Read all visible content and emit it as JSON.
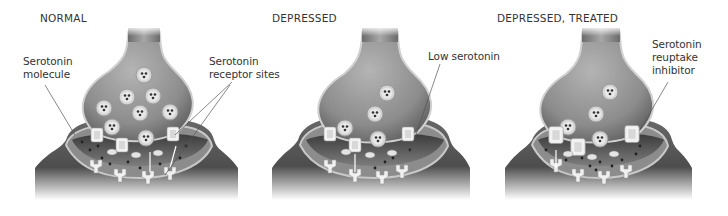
{
  "panels": [
    {
      "title": "NORMAL",
      "labels": [
        {
          "line1": "Serotonin",
          "line2": "molecule"
        },
        {
          "line1": "Serotonin",
          "line2": "receptor sites"
        }
      ]
    },
    {
      "title": "DEPRESSED",
      "labels": [
        {
          "line1": "Low serotonin"
        }
      ]
    },
    {
      "title": "DEPRESSED, TREATED",
      "labels": [
        {
          "line1": "Serotonin",
          "line2": "reuptake",
          "line3": "inhibitor"
        }
      ]
    }
  ],
  "colors": {
    "background": "#ffffff",
    "neuron_dark": "#4a4a4a",
    "neuron_mid": "#8a8a8a",
    "neuron_light": "#c8c8c8",
    "vesicle": "#d9d9d9",
    "receptor": "#ededed",
    "text": "#333333"
  }
}
